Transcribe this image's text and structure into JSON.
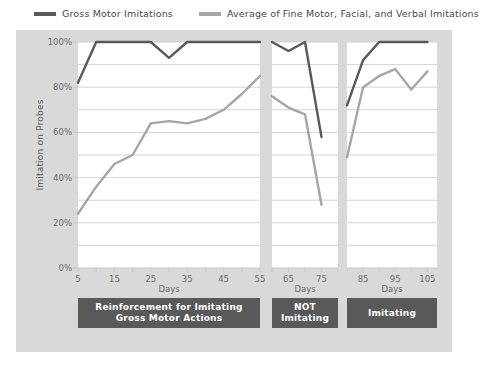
{
  "colors": {
    "series_gross": "#595959",
    "series_average": "#a6a6a6",
    "outer_panel": "#d9d9d9",
    "plot_background": "#ffffff",
    "gridline": "#c9c9c9",
    "phase_box": "#595959",
    "phase_text": "#ffffff",
    "axis_text": "#6b6b6b"
  },
  "legend": {
    "items": [
      {
        "label": "Gross Motor Imitations",
        "color": "#595959",
        "icon": "line-swatch-icon"
      },
      {
        "label": "Average of Fine Motor, Facial, and Verbal Imitations",
        "color": "#a6a6a6",
        "icon": "line-swatch-icon"
      }
    ]
  },
  "axes": {
    "ylabel": "Imitation on Probes",
    "ytick_labels": [
      "0%",
      "20%",
      "40%",
      "60%",
      "80%",
      "100%"
    ],
    "ytick_values": [
      0,
      20,
      40,
      60,
      80,
      100
    ],
    "yminor_values": [
      10,
      30,
      50,
      70,
      90
    ],
    "ylim": [
      0,
      100
    ],
    "xlabel": "Days"
  },
  "phases": [
    {
      "label": "Reinforcement for Imitating\nGross Motor Actions",
      "line1": "Reinforcement for Imitating",
      "line2": "Gross Motor Actions"
    },
    {
      "label": "NOT\nImitating",
      "line1": "NOT",
      "line2": "Imitating"
    },
    {
      "label": "Imitating",
      "line1": "Imitating",
      "line2": ""
    }
  ],
  "chart_data": {
    "type": "line",
    "title": "",
    "xlabel": "Days",
    "ylabel": "Imitation on Probes",
    "ylim": [
      0,
      100
    ],
    "grid": true,
    "legend_position": "top",
    "panels": [
      {
        "name": "Reinforcement for Imitating Gross Motor Actions",
        "xlim": [
          5,
          55
        ],
        "xticks": [
          5,
          10,
          15,
          20,
          25,
          30,
          35,
          40,
          45,
          50,
          55
        ],
        "xtick_labels": [
          "5",
          "",
          "15",
          "",
          "25",
          "",
          "35",
          "",
          "45",
          "",
          "55"
        ],
        "series": [
          {
            "name": "Gross Motor Imitations",
            "x": [
              5,
              10,
              15,
              20,
              25,
              30,
              35,
              40,
              45,
              50,
              55
            ],
            "values": [
              82,
              100,
              100,
              100,
              100,
              93,
              100,
              100,
              100,
              100,
              100
            ]
          },
          {
            "name": "Average of Fine Motor, Facial, and Verbal Imitations",
            "x": [
              5,
              10,
              15,
              20,
              25,
              30,
              35,
              40,
              45,
              50,
              55
            ],
            "values": [
              24,
              36,
              46,
              50,
              64,
              65,
              64,
              66,
              70,
              77,
              85
            ]
          }
        ]
      },
      {
        "name": "NOT Imitating",
        "xlim": [
          60,
          80
        ],
        "xticks": [
          60,
          65,
          70,
          75,
          80
        ],
        "xtick_labels": [
          "",
          "65",
          "",
          "75",
          ""
        ],
        "series": [
          {
            "name": "Gross Motor Imitations",
            "x": [
              60,
              65,
              70,
              75
            ],
            "values": [
              100,
              96,
              100,
              58
            ]
          },
          {
            "name": "Average of Fine Motor, Facial, and Verbal Imitations",
            "x": [
              60,
              65,
              70,
              75
            ],
            "values": [
              76,
              71,
              68,
              28
            ]
          }
        ]
      },
      {
        "name": "Imitating",
        "xlim": [
          80,
          108
        ],
        "xticks": [
          80,
          85,
          90,
          95,
          100,
          105
        ],
        "xtick_labels": [
          "",
          "85",
          "",
          "95",
          "",
          "105"
        ],
        "series": [
          {
            "name": "Gross Motor Imitations",
            "x": [
              80,
              85,
              90,
              95,
              100,
              105
            ],
            "values": [
              72,
              92,
              100,
              100,
              100,
              100
            ]
          },
          {
            "name": "Average of Fine Motor, Facial, and Verbal Imitations",
            "x": [
              80,
              85,
              90,
              95,
              100,
              105
            ],
            "values": [
              49,
              80,
              85,
              88,
              79,
              87
            ]
          }
        ]
      }
    ]
  }
}
